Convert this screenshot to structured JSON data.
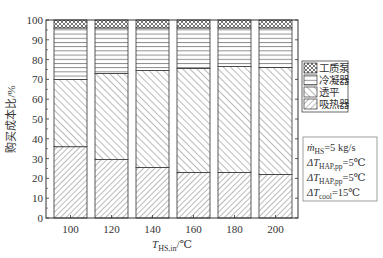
{
  "chart_data": {
    "type": "bar",
    "stacked": true,
    "percent": true,
    "title": "",
    "xlabel": "T_HS,in/℃",
    "ylabel": "购买成本比/%",
    "ylim": [
      0,
      100
    ],
    "yticks": [
      0,
      10,
      20,
      30,
      40,
      50,
      60,
      70,
      80,
      90,
      100
    ],
    "categories": [
      "100",
      "120",
      "140",
      "160",
      "180",
      "200"
    ],
    "series": [
      {
        "name": "吸热器",
        "pattern": "forward-diagonal",
        "values": [
          36,
          29.5,
          25.5,
          23,
          23,
          22
        ]
      },
      {
        "name": "透平",
        "pattern": "back-diagonal",
        "values": [
          34,
          43.5,
          49,
          52.5,
          53.5,
          54
        ]
      },
      {
        "name": "冷凝器",
        "pattern": "horizontal-lines",
        "values": [
          26,
          23,
          21.5,
          20.5,
          19.5,
          20
        ]
      },
      {
        "name": "工质泵",
        "pattern": "crosshatch",
        "values": [
          4,
          4,
          4,
          4,
          4,
          4
        ]
      }
    ],
    "legend": {
      "position": "right",
      "entries": [
        "工质泵",
        "冷凝器",
        "透平",
        "吸热器"
      ]
    },
    "annotations": [
      "ṁHS=5 kg/s",
      "ΔTHAP,pp=5℃",
      "ΔTHAP,pp=5℃",
      "ΔTcool=15℃"
    ],
    "grid": false
  },
  "axis": {
    "ylabel": "购买成本比/%",
    "xlabel_main": "T",
    "xlabel_sub": "HS,in",
    "xlabel_unit": "/℃"
  },
  "legend": {
    "items": [
      {
        "label": "工质泵",
        "pattern": "crosshatch"
      },
      {
        "label": "冷凝器",
        "pattern": "horizontal-lines"
      },
      {
        "label": "透平",
        "pattern": "back-diagonal"
      },
      {
        "label": "吸热器",
        "pattern": "forward-diagonal"
      }
    ]
  },
  "annotation_box": {
    "lines": [
      {
        "main": "ṁ",
        "sub": "HS",
        "rest": "=5 kg/s"
      },
      {
        "main": "ΔT",
        "sub": "HAP,pp",
        "rest": "=5℃"
      },
      {
        "main": "ΔT",
        "sub": "HAP,pp",
        "rest": "=5℃"
      },
      {
        "main": "ΔT",
        "sub": "cool",
        "rest": "=15℃"
      }
    ]
  }
}
